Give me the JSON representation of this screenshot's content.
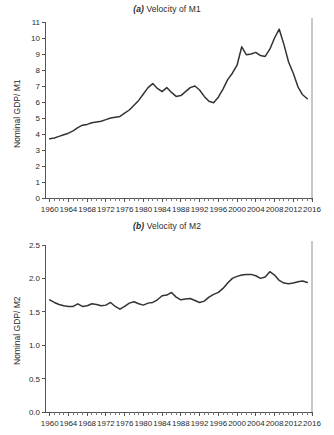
{
  "figure": {
    "panels": [
      {
        "id": "m1",
        "title_letter": "(a)",
        "title_text": " Velocity of M1",
        "ylabel": "Nominal GDP/ M1"
      },
      {
        "id": "m2",
        "title_letter": "(b)",
        "title_text": " Velocity of M2",
        "ylabel": "Nominal GDP/ M2"
      }
    ],
    "line_color": "#333333",
    "axis_color": "#555555",
    "background": "#ffffff"
  },
  "chart_data": [
    {
      "type": "line",
      "title": "(a) Velocity of M1",
      "xlabel": "",
      "ylabel": "Nominal GDP/ M1",
      "xlim": [
        1959,
        2016
      ],
      "ylim": [
        0,
        11
      ],
      "yticks": [
        0,
        1,
        2,
        3,
        4,
        5,
        6,
        7,
        8,
        9,
        10,
        11
      ],
      "ytick_labels": [
        "0",
        "1",
        "2",
        "3",
        "4",
        "5",
        "6",
        "7",
        "8",
        "9",
        "10",
        "11"
      ],
      "xticks": [
        1960,
        1964,
        1968,
        1972,
        1976,
        1980,
        1984,
        1988,
        1992,
        1996,
        2000,
        2004,
        2008,
        2012,
        2016
      ],
      "xtick_labels": [
        "1960",
        "1964",
        "1968",
        "1972",
        "1976",
        "1980",
        "1984",
        "1988",
        "1992",
        "1996",
        "2000",
        "2004",
        "2008",
        "2012",
        "2016"
      ],
      "minor_xticks": "annual",
      "grid": false,
      "legend": false,
      "series": [
        {
          "name": "Velocity of M1",
          "x": [
            1960,
            1961,
            1962,
            1963,
            1964,
            1965,
            1966,
            1967,
            1968,
            1969,
            1970,
            1971,
            1972,
            1973,
            1974,
            1975,
            1976,
            1977,
            1978,
            1979,
            1980,
            1981,
            1982,
            1983,
            1984,
            1985,
            1986,
            1987,
            1988,
            1989,
            1990,
            1991,
            1992,
            1993,
            1994,
            1995,
            1996,
            1997,
            1998,
            1999,
            2000,
            2001,
            2002,
            2003,
            2004,
            2005,
            2006,
            2007,
            2008,
            2009,
            2010,
            2011,
            2012,
            2013,
            2014,
            2015
          ],
          "values": [
            3.7,
            3.75,
            3.85,
            3.95,
            4.05,
            4.2,
            4.4,
            4.55,
            4.6,
            4.7,
            4.75,
            4.8,
            4.9,
            5.0,
            5.05,
            5.1,
            5.3,
            5.5,
            5.8,
            6.1,
            6.5,
            6.9,
            7.15,
            6.85,
            6.65,
            6.9,
            6.6,
            6.35,
            6.4,
            6.65,
            6.9,
            7.0,
            6.75,
            6.35,
            6.05,
            5.95,
            6.3,
            6.8,
            7.4,
            7.8,
            8.3,
            9.45,
            8.95,
            9.0,
            9.1,
            8.9,
            8.85,
            9.3,
            10.0,
            10.55,
            9.6,
            8.5,
            7.8,
            6.95,
            6.45,
            6.2,
            6.1
          ],
          "color": "#333333"
        }
      ]
    },
    {
      "type": "line",
      "title": "(b) Velocity of M2",
      "xlabel": "",
      "ylabel": "Nominal GDP/ M2",
      "xlim": [
        1959,
        2016
      ],
      "ylim": [
        0.0,
        2.5
      ],
      "yticks": [
        0.0,
        0.5,
        1.0,
        1.5,
        2.0,
        2.5
      ],
      "ytick_labels": [
        "0.0",
        "0.5",
        "1.0",
        "1.5",
        "2.0",
        "2.5"
      ],
      "xticks": [
        1960,
        1964,
        1968,
        1972,
        1976,
        1980,
        1984,
        1988,
        1992,
        1996,
        2000,
        2004,
        2008,
        2012,
        2016
      ],
      "xtick_labels": [
        "1960",
        "1964",
        "1968",
        "1972",
        "1976",
        "1980",
        "1984",
        "1988",
        "1992",
        "1996",
        "2000",
        "2004",
        "2008",
        "2012",
        "2016"
      ],
      "minor_xticks": "annual",
      "grid": false,
      "legend": false,
      "series": [
        {
          "name": "Velocity of M2",
          "x": [
            1960,
            1961,
            1962,
            1963,
            1964,
            1965,
            1966,
            1967,
            1968,
            1969,
            1970,
            1971,
            1972,
            1973,
            1974,
            1975,
            1976,
            1977,
            1978,
            1979,
            1980,
            1981,
            1982,
            1983,
            1984,
            1985,
            1986,
            1987,
            1988,
            1989,
            1990,
            1991,
            1992,
            1993,
            1994,
            1995,
            1996,
            1997,
            1998,
            1999,
            2000,
            2001,
            2002,
            2003,
            2004,
            2005,
            2006,
            2007,
            2008,
            2009,
            2010,
            2011,
            2012,
            2013,
            2014,
            2015
          ],
          "values": [
            1.68,
            1.64,
            1.61,
            1.59,
            1.58,
            1.58,
            1.62,
            1.58,
            1.59,
            1.62,
            1.61,
            1.59,
            1.6,
            1.64,
            1.58,
            1.54,
            1.58,
            1.63,
            1.65,
            1.62,
            1.6,
            1.63,
            1.64,
            1.68,
            1.74,
            1.75,
            1.79,
            1.72,
            1.68,
            1.69,
            1.7,
            1.67,
            1.64,
            1.66,
            1.72,
            1.76,
            1.79,
            1.85,
            1.93,
            2.0,
            2.03,
            2.05,
            2.06,
            2.06,
            2.04,
            2.0,
            2.02,
            2.1,
            2.05,
            1.97,
            1.93,
            1.92,
            1.93,
            1.95,
            1.96,
            1.94,
            1.86,
            1.78,
            1.74,
            1.71,
            1.65,
            1.6,
            1.56,
            1.52,
            1.49,
            1.48
          ],
          "color": "#333333"
        }
      ]
    }
  ]
}
